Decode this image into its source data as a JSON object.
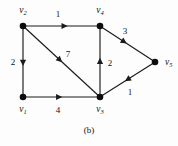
{
  "figure": {
    "caption": "(b)",
    "type": "directed-weighted-graph",
    "background_color": "#fdfdfd",
    "ink_color": "#1b1b1b"
  },
  "vertices": [
    {
      "id": "v1",
      "label_base": "v",
      "label_sub": "1",
      "x": 23,
      "y": 97,
      "label_x": 23,
      "label_y": 112,
      "label_anchor": "middle"
    },
    {
      "id": "v2",
      "label_base": "v",
      "label_sub": "2",
      "x": 23,
      "y": 26,
      "label_x": 23,
      "label_y": 13,
      "label_anchor": "middle"
    },
    {
      "id": "v3",
      "label_base": "v",
      "label_sub": "3",
      "x": 100,
      "y": 97,
      "label_x": 100,
      "label_y": 112,
      "label_anchor": "middle"
    },
    {
      "id": "v4",
      "label_base": "v",
      "label_sub": "4",
      "x": 100,
      "y": 26,
      "label_x": 100,
      "label_y": 13,
      "label_anchor": "middle"
    },
    {
      "id": "v5",
      "label_base": "v",
      "label_sub": "5",
      "x": 155,
      "y": 62,
      "label_x": 165,
      "label_y": 65,
      "label_anchor": "start"
    }
  ],
  "edges": [
    {
      "id": "e-v2-v4",
      "from": "v2",
      "to": "v4",
      "weight": "1",
      "x1": 23,
      "y1": 26,
      "x2": 100,
      "y2": 26,
      "arrow_t": 0.54,
      "label_x": 58,
      "label_y": 17
    },
    {
      "id": "e-v2-v1",
      "from": "v2",
      "to": "v1",
      "weight": "2",
      "x1": 23,
      "y1": 26,
      "x2": 23,
      "y2": 97,
      "arrow_t": 0.52,
      "label_x": 13,
      "label_y": 65
    },
    {
      "id": "e-v2-v3",
      "from": "v2",
      "to": "v3",
      "weight": "7",
      "x1": 23,
      "y1": 26,
      "x2": 100,
      "y2": 97,
      "arrow_t": 0.48,
      "label_x": 68,
      "label_y": 57
    },
    {
      "id": "e-v1-v3",
      "from": "v1",
      "to": "v3",
      "weight": "4",
      "x1": 23,
      "y1": 97,
      "x2": 100,
      "y2": 97,
      "arrow_t": 0.47,
      "label_x": 58,
      "label_y": 113
    },
    {
      "id": "e-v3-v4",
      "from": "v3",
      "to": "v4",
      "weight": "2",
      "x1": 100,
      "y1": 97,
      "x2": 100,
      "y2": 26,
      "arrow_t": 0.51,
      "label_x": 110,
      "label_y": 66
    },
    {
      "id": "e-v4-v5",
      "from": "v4",
      "to": "v5",
      "weight": "3",
      "x1": 100,
      "y1": 26,
      "x2": 155,
      "y2": 62,
      "arrow_t": 0.44,
      "label_x": 125,
      "label_y": 34
    },
    {
      "id": "e-v5-v3",
      "from": "v5",
      "to": "v3",
      "weight": "1",
      "x1": 155,
      "y1": 62,
      "x2": 100,
      "y2": 97,
      "arrow_t": 0.5,
      "label_x": 130,
      "label_y": 95
    }
  ],
  "chart_data": {
    "type": "diagram",
    "title": "(b)",
    "nodes": [
      "v1",
      "v2",
      "v3",
      "v4",
      "v5"
    ],
    "directed": true,
    "weighted": true,
    "edges": [
      {
        "source": "v2",
        "target": "v4",
        "weight": 1
      },
      {
        "source": "v2",
        "target": "v1",
        "weight": 2
      },
      {
        "source": "v2",
        "target": "v3",
        "weight": 7
      },
      {
        "source": "v1",
        "target": "v3",
        "weight": 4
      },
      {
        "source": "v3",
        "target": "v4",
        "weight": 2
      },
      {
        "source": "v4",
        "target": "v5",
        "weight": 3
      },
      {
        "source": "v5",
        "target": "v3",
        "weight": 1
      }
    ]
  }
}
